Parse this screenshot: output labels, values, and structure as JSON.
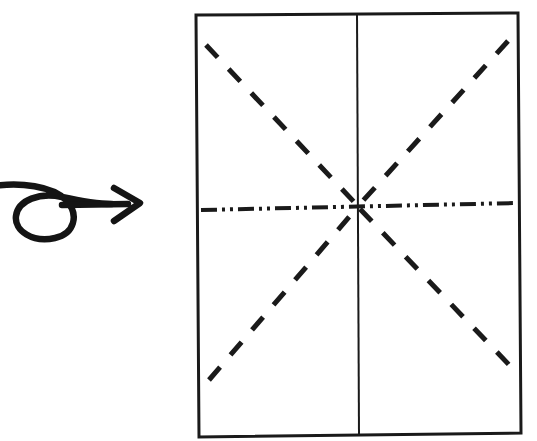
{
  "figure": {
    "kind": "origami-fold-diagram",
    "canvas": {
      "width": 537,
      "height": 441
    },
    "background_color": "#ffffff",
    "ink_color": "#1a1a1a",
    "labels": {
      "none_visible": true
    }
  },
  "arrow": {
    "name": "curled-instruction-arrow",
    "color": "#141414",
    "stroke_width": 6.5,
    "description": "Hand-drawn arrow with a looped curl at the tail, pointing right toward the paper diagram",
    "loop": {
      "center_x": 46,
      "center_y": 212,
      "radius_x": 28,
      "radius_y": 22
    },
    "shaft": {
      "x1": 62,
      "y1": 205,
      "x2": 128,
      "y2": 204
    },
    "head": {
      "tip_x": 140,
      "tip_y": 203,
      "upper_x": 114,
      "upper_y": 188,
      "lower_x": 114,
      "lower_y": 221
    }
  },
  "sheet": {
    "name": "paper-rectangle",
    "stroke_color": "#1a1a1a",
    "stroke_width": 3,
    "fill": "#ffffff",
    "corners": {
      "top_left": {
        "x": 196,
        "y": 15
      },
      "top_right": {
        "x": 518,
        "y": 13
      },
      "bottom_right": {
        "x": 521,
        "y": 433
      },
      "bottom_left": {
        "x": 199,
        "y": 437
      }
    }
  },
  "center_point": {
    "x": 358,
    "y": 206
  },
  "fold_lines": [
    {
      "id": "vertical-center-fold",
      "name": "vertical-center-line",
      "style": "solid",
      "meaning": "existing crease / center line",
      "stroke_width": 2,
      "color": "#1a1a1a",
      "x1": 357,
      "y1": 14,
      "x2": 359,
      "y2": 435,
      "dasharray": ""
    },
    {
      "id": "horizontal-center-fold",
      "name": "horizontal-dash-dot-line",
      "style": "dash-dot-dot",
      "meaning": "mountain fold",
      "stroke_width": 4,
      "color": "#1a1a1a",
      "x1": 201,
      "y1": 210,
      "x2": 517,
      "y2": 203,
      "dasharray": "16 5 3 5 3 5"
    },
    {
      "id": "diagonal-tl-center",
      "name": "diagonal-top-left",
      "style": "dashed",
      "meaning": "valley fold",
      "stroke_width": 5,
      "color": "#1a1a1a",
      "x1": 206,
      "y1": 45,
      "x2": 356,
      "y2": 204,
      "dasharray": "17 16"
    },
    {
      "id": "diagonal-tr-center",
      "name": "diagonal-top-right",
      "style": "dashed",
      "meaning": "valley fold",
      "stroke_width": 5,
      "color": "#1a1a1a",
      "x1": 508,
      "y1": 41,
      "x2": 360,
      "y2": 204,
      "dasharray": "17 16"
    },
    {
      "id": "diagonal-bl-center",
      "name": "diagonal-bottom-left",
      "style": "dashed",
      "meaning": "valley fold",
      "stroke_width": 5,
      "color": "#1a1a1a",
      "x1": 209,
      "y1": 380,
      "x2": 356,
      "y2": 209,
      "dasharray": "17 16"
    },
    {
      "id": "diagonal-br-center",
      "name": "diagonal-bottom-right",
      "style": "dashed",
      "meaning": "valley fold",
      "stroke_width": 5,
      "color": "#1a1a1a",
      "x1": 360,
      "y1": 209,
      "x2": 514,
      "y2": 370,
      "dasharray": "17 16"
    }
  ]
}
